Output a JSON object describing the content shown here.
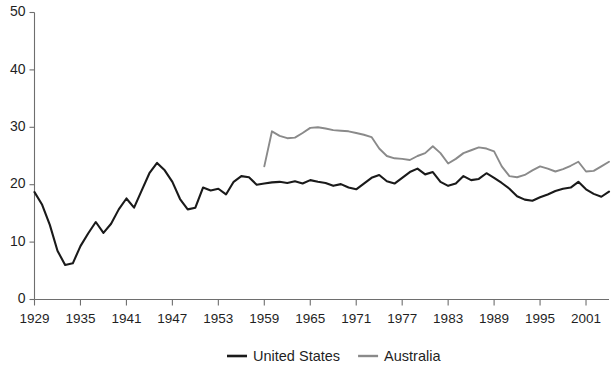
{
  "chart_data": {
    "type": "line",
    "title": "",
    "subtitle": "",
    "xlabel": "",
    "ylabel": "",
    "xlim": [
      1929,
      2004
    ],
    "ylim": [
      0,
      50
    ],
    "grid": false,
    "legend_position": "bottom-center",
    "y_ticks": [
      0,
      10,
      20,
      30,
      40,
      50
    ],
    "y_tick_labels": [
      "0",
      "10",
      "20",
      "30",
      "40",
      "50"
    ],
    "x_ticks": [
      1929,
      1935,
      1941,
      1947,
      1953,
      1959,
      1965,
      1971,
      1977,
      1983,
      1989,
      1995,
      2001
    ],
    "x_tick_labels": [
      "1929",
      "1935",
      "1941",
      "1947",
      "1953",
      "1959",
      "1965",
      "1971",
      "1977",
      "1983",
      "1989",
      "1995",
      "2001"
    ],
    "series": [
      {
        "name": "United States",
        "color": "#1a1a1a",
        "x": [
          1929,
          1930,
          1931,
          1932,
          1933,
          1934,
          1935,
          1936,
          1937,
          1938,
          1939,
          1940,
          1941,
          1942,
          1943,
          1944,
          1945,
          1946,
          1947,
          1948,
          1949,
          1950,
          1951,
          1952,
          1953,
          1954,
          1955,
          1956,
          1957,
          1958,
          1959,
          1960,
          1961,
          1962,
          1963,
          1964,
          1965,
          1966,
          1967,
          1968,
          1969,
          1970,
          1971,
          1972,
          1973,
          1974,
          1975,
          1976,
          1977,
          1978,
          1979,
          1980,
          1981,
          1982,
          1983,
          1984,
          1985,
          1986,
          1987,
          1988,
          1989,
          1990,
          1991,
          1992,
          1993,
          1994,
          1995,
          1996,
          1997,
          1998,
          1999,
          2000,
          2001,
          2002,
          2003,
          2004
        ],
        "values": [
          18.7,
          16.5,
          13.0,
          8.5,
          6.0,
          6.3,
          9.3,
          11.5,
          13.5,
          11.6,
          13.2,
          15.7,
          17.6,
          16.0,
          19.0,
          22.0,
          23.8,
          22.5,
          20.5,
          17.5,
          15.7,
          16.0,
          19.5,
          19.0,
          19.3,
          18.3,
          20.5,
          21.5,
          21.3,
          20.0,
          20.2,
          20.4,
          20.5,
          20.3,
          20.6,
          20.2,
          20.8,
          20.5,
          20.3,
          19.8,
          20.1,
          19.5,
          19.2,
          20.2,
          21.2,
          21.7,
          20.6,
          20.2,
          21.2,
          22.2,
          22.8,
          21.8,
          22.2,
          20.5,
          19.8,
          20.2,
          21.5,
          20.8,
          21.0,
          22.0,
          21.2,
          20.3,
          19.3,
          18.0,
          17.4,
          17.2,
          17.8,
          18.3,
          18.9,
          19.3,
          19.5,
          20.5,
          19.2,
          18.4,
          17.9,
          18.8
        ]
      },
      {
        "name": "Australia",
        "color": "#8a8a8a",
        "x": [
          1959,
          1960,
          1961,
          1962,
          1963,
          1964,
          1965,
          1966,
          1967,
          1968,
          1969,
          1970,
          1971,
          1972,
          1973,
          1974,
          1975,
          1976,
          1977,
          1978,
          1979,
          1980,
          1981,
          1982,
          1983,
          1984,
          1985,
          1986,
          1987,
          1988,
          1989,
          1990,
          1991,
          1992,
          1993,
          1994,
          1995,
          1996,
          1997,
          1998,
          1999,
          2000,
          2001,
          2002,
          2003,
          2004
        ],
        "values": [
          23.2,
          29.3,
          28.5,
          28.1,
          28.2,
          29.0,
          29.9,
          30.0,
          29.8,
          29.5,
          29.4,
          29.3,
          29.0,
          28.7,
          28.3,
          26.3,
          25.0,
          24.6,
          24.5,
          24.3,
          25.0,
          25.5,
          26.7,
          25.5,
          23.7,
          24.5,
          25.5,
          26.0,
          26.5,
          26.3,
          25.8,
          23.2,
          21.5,
          21.3,
          21.7,
          22.5,
          23.2,
          22.8,
          22.3,
          22.7,
          23.3,
          24.0,
          22.3,
          22.4,
          23.2,
          24.0
        ]
      }
    ],
    "legend": [
      {
        "label": "United States",
        "color": "#1a1a1a",
        "marker": "line"
      },
      {
        "label": "Australia",
        "color": "#8a8a8a",
        "marker": "line"
      }
    ]
  }
}
